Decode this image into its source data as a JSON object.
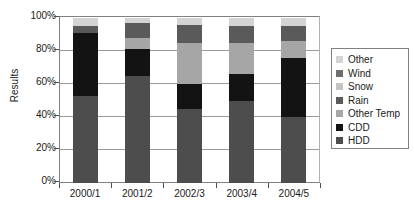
{
  "chart_data": {
    "type": "bar",
    "subtype": "stacked-percent",
    "title": "",
    "xlabel": "",
    "ylabel": "Results",
    "ylim": [
      0,
      100
    ],
    "ytick_labels": [
      "100%",
      "80%",
      "60%",
      "40%",
      "20%",
      "0%"
    ],
    "ytick_values": [
      100,
      80,
      60,
      40,
      20,
      0
    ],
    "grid": true,
    "legend_position": "right",
    "categories": [
      "2000/1",
      "2001/2",
      "2002/3",
      "2003/4",
      "2004/5"
    ],
    "series": [
      {
        "name": "HDD",
        "color": "#4d4d4d",
        "values": [
          53,
          65,
          45,
          50,
          40
        ]
      },
      {
        "name": "CDD",
        "color": "#131313",
        "values": [
          38,
          16,
          15,
          16,
          36
        ]
      },
      {
        "name": "Other Temp",
        "color": "#a6a6a6",
        "values": [
          0,
          7,
          25,
          19,
          10
        ]
      },
      {
        "name": "Rain",
        "color": "#5a5a5a",
        "values": [
          4,
          9,
          11,
          10,
          9
        ]
      },
      {
        "name": "Snow",
        "color": "#c4c4c4",
        "values": [
          0,
          0,
          0,
          0,
          0
        ]
      },
      {
        "name": "Wind",
        "color": "#6e6e6e",
        "values": [
          0,
          0,
          0,
          0,
          0
        ]
      },
      {
        "name": "Other",
        "color": "#d4d4d4",
        "values": [
          5,
          3,
          4,
          5,
          5
        ]
      }
    ],
    "legend_entries": [
      {
        "label": "Other",
        "color": "#d4d4d4"
      },
      {
        "label": "Wind",
        "color": "#6e6e6e"
      },
      {
        "label": "Snow",
        "color": "#c4c4c4"
      },
      {
        "label": "Rain",
        "color": "#5a5a5a"
      },
      {
        "label": "Other Temp",
        "color": "#a6a6a6"
      },
      {
        "label": "CDD",
        "color": "#131313"
      },
      {
        "label": "HDD",
        "color": "#4d4d4d"
      }
    ]
  }
}
